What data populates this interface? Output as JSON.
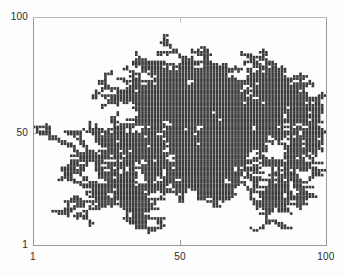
{
  "figure": {
    "title": "",
    "background_color": "#fdfdfd",
    "axis_color": "#9a9a9a",
    "particle_color": "#3a3a3a"
  },
  "axes": {
    "y_labels": {
      "top": "100",
      "middle": "50",
      "bottom": "1"
    },
    "x_labels": {
      "left": "1",
      "middle": "50",
      "right": "100"
    }
  },
  "chart_data": {
    "type": "scatter",
    "title": "",
    "xlabel": "",
    "ylabel": "",
    "xlim": [
      1,
      100
    ],
    "ylim": [
      1,
      100
    ],
    "xticks": [
      1,
      50,
      100
    ],
    "yticks": [
      1,
      50,
      100
    ],
    "xticklabels": [
      "1",
      "50",
      "100"
    ],
    "yticklabels": [
      "1",
      "50",
      "100"
    ],
    "grid": false,
    "legend": null,
    "marker": "square",
    "marker_size": 2.6,
    "color": "#3a3a3a",
    "seed": [
      50,
      50
    ],
    "n_points": 1900,
    "branches": [
      {
        "name": "north-arm",
        "angle_deg": 78,
        "length": 42,
        "spread": 13
      },
      {
        "name": "north-east-arm",
        "angle_deg": 47,
        "length": 30,
        "spread": 11
      },
      {
        "name": "east-arm",
        "angle_deg": 4,
        "length": 38,
        "spread": 10
      },
      {
        "name": "east-low-arm",
        "angle_deg": -22,
        "length": 36,
        "spread": 12
      },
      {
        "name": "south-east-arm",
        "angle_deg": -55,
        "length": 30,
        "spread": 11
      },
      {
        "name": "south-arm",
        "angle_deg": -88,
        "length": 34,
        "spread": 12
      },
      {
        "name": "south-west-arm",
        "angle_deg": -128,
        "length": 33,
        "spread": 12
      },
      {
        "name": "west-arm",
        "angle_deg": 172,
        "length": 37,
        "spread": 11
      },
      {
        "name": "north-west-arm",
        "angle_deg": 140,
        "length": 28,
        "spread": 10
      },
      {
        "name": "north-north-west-arm",
        "angle_deg": 104,
        "length": 26,
        "spread": 9
      }
    ],
    "extent_data": {
      "xmin": 14,
      "xmax": 92,
      "ymin": 13,
      "ymax": 92
    }
  }
}
